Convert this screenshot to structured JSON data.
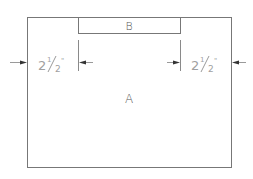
{
  "diagram": {
    "shapes": {
      "outer": {
        "label": "A",
        "x": 27,
        "y": 17,
        "width": 204,
        "height": 150
      },
      "inner": {
        "label": "B",
        "x": 78,
        "y": 17,
        "width": 102,
        "height": 16
      }
    },
    "dimensions": {
      "left": {
        "whole": "2",
        "numerator": "1",
        "denominator": "2",
        "unit": "\"",
        "text": "2 1/2\""
      },
      "right": {
        "whole": "2",
        "numerator": "1",
        "denominator": "2",
        "unit": "\"",
        "text": "2 1/2\""
      }
    },
    "colors": {
      "outline": "#777777",
      "dimension_text": "#a0a0a0",
      "arrow": "#333333",
      "label": "#555555"
    }
  }
}
